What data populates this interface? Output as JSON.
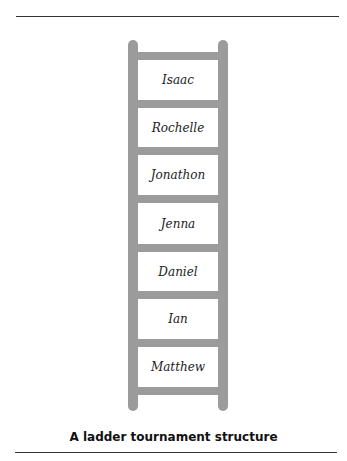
{
  "diagram": {
    "type": "ladder",
    "caption": "A ladder tournament structure",
    "rungs_from_top": [
      "Isaac",
      "Rochelle",
      "Jonathon",
      "Jenna",
      "Daniel",
      "Ian",
      "Matthew"
    ],
    "colors": {
      "ladder": "#9b9b9b",
      "text": "#222222",
      "rule": "#333333"
    }
  }
}
